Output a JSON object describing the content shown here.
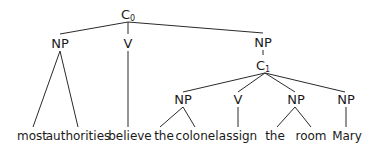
{
  "tree": {
    "root": {
      "label": "C",
      "subscript": "0"
    },
    "level1": [
      {
        "label": "NP"
      },
      {
        "label": "V"
      },
      {
        "label": "NP"
      }
    ],
    "embedded_clause": {
      "label": "C",
      "subscript": "1"
    },
    "level3": [
      {
        "label": "NP"
      },
      {
        "label": "V"
      },
      {
        "label": "NP"
      },
      {
        "label": "NP"
      }
    ],
    "words": [
      "most",
      "authorities",
      "believe",
      "the",
      "colonel",
      "assign",
      "the",
      "room",
      "Mary"
    ]
  }
}
